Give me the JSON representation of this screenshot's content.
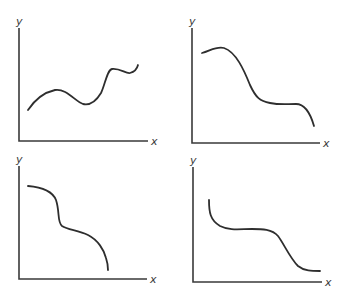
{
  "panels": [
    {
      "id": "top-left",
      "x_label": "x",
      "y_label": "y",
      "description": "wavy rising curve: rise, dip, sharp rise, plateau",
      "axis": {
        "origin": [
          19,
          141
        ],
        "x_end": 148,
        "y_top": 28
      },
      "curve_path": "M28,110 C36,98 46,92 55,90 C66,88 76,102 83,104 C92,106 98,98 101,93 C105,85 107,70 112,69 C120,68 126,74 130,73 C134,72 137,69 138,65"
    },
    {
      "id": "top-right",
      "x_label": "x",
      "y_label": "y",
      "description": "decreasing curve: slight rise, steep drop, plateau, drop",
      "axis": {
        "origin": [
          192,
          143
        ],
        "x_end": 320,
        "y_top": 28
      },
      "curve_path": "M202,53 C210,51 216,46 224,48 C236,52 244,70 250,85 C256,98 260,101 270,103 C280,105 286,104 296,104 C304,104 310,112 314,126"
    },
    {
      "id": "bottom-left",
      "x_label": "x",
      "y_label": "y",
      "description": "decreasing curve: gentle fall, steep drop, shoulder, steep fall",
      "axis": {
        "origin": [
          19,
          279
        ],
        "x_end": 147,
        "y_top": 166
      },
      "curve_path": "M28,186 C40,187 52,190 56,200 C60,212 57,222 62,226 C68,230 78,230 88,235 C98,240 104,250 106,258 C108,264 108,268 108,270"
    },
    {
      "id": "bottom-right",
      "x_label": "x",
      "y_label": "y",
      "description": "decreasing curve: steep drop, plateau, drop, flat",
      "axis": {
        "origin": [
          193,
          282
        ],
        "x_end": 322,
        "y_top": 167
      },
      "curve_path": "M209,200 C209,212 210,220 220,226 C230,231 240,229 252,229 C262,229 272,229 278,236 C284,244 290,258 298,266 C304,271 312,271 320,271"
    }
  ]
}
